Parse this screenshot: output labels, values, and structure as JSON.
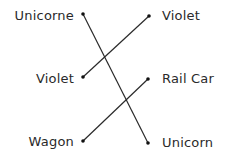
{
  "matching": {
    "left": [
      {
        "label": "Unicorne",
        "dot": [
          83,
          14
        ]
      },
      {
        "label": "Violet",
        "dot": [
          83,
          77
        ]
      },
      {
        "label": "Wagon",
        "dot": [
          83,
          141
        ]
      }
    ],
    "right": [
      {
        "label": "Violet",
        "dot": [
          149,
          16
        ]
      },
      {
        "label": "Rail Car",
        "dot": [
          148,
          79
        ]
      },
      {
        "label": "Unicorn",
        "dot": [
          148,
          143
        ]
      }
    ],
    "connections": [
      {
        "from": "Unicorne",
        "to": "Unicorn"
      },
      {
        "from": "Violet",
        "to": "Violet"
      },
      {
        "from": "Wagon",
        "to": "Rail Car"
      }
    ],
    "line_color": "#2a2a2a",
    "text_color": "#2a2a2a"
  }
}
